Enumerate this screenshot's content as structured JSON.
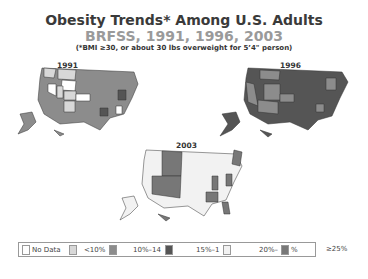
{
  "header": {
    "title": "Obesity Trends* Among U.S. Adults",
    "subtitle": "BRFSS, 1991, 1996, 2003",
    "note": "(*BMI ≥30, or about 30 lbs overweight for 5’4\" person)"
  },
  "maps": [
    {
      "year": "1991"
    },
    {
      "year": "1996"
    },
    {
      "year": "2003"
    }
  ],
  "legend": {
    "items": [
      {
        "label": "No Data",
        "color": "#ffffff"
      },
      {
        "label": "<10%",
        "color": "#d8d8d8"
      },
      {
        "label": "10%–14",
        "color": "#8c8c8c"
      },
      {
        "label": "15%–1",
        "color": "#555555"
      },
      {
        "label": "20%–",
        "color": "#f2f2f2"
      },
      {
        "label": "%",
        "color": "#777777"
      }
    ],
    "outside_label": "≥25%"
  },
  "colors": {
    "nodata": "#ffffff",
    "lt10": "#d8d8d8",
    "c10_14": "#8c8c8c",
    "c15_19": "#555555",
    "c20_24": "#f2f2f2",
    "ge25": "#777777",
    "border": "#333333"
  }
}
